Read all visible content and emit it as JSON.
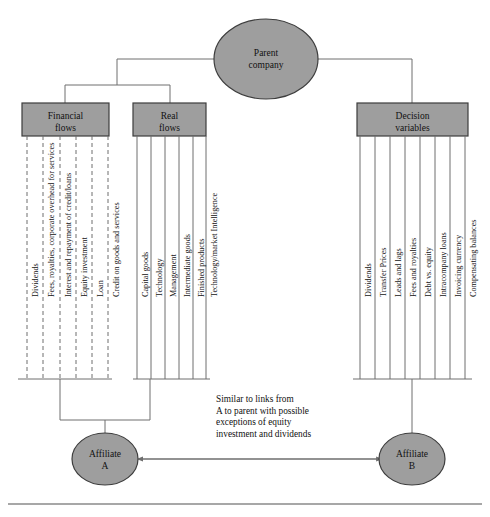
{
  "diagram": {
    "colors": {
      "node_fill": "#9e9e9e",
      "node_stroke": "#3d3d3d",
      "line": "#6e6e6e",
      "text": "#111111",
      "background": "#ffffff"
    },
    "nodes": {
      "parent": {
        "label": "Parent\ncompany",
        "line1": "Parent",
        "line2": "company",
        "shape": "ellipse"
      },
      "affiliate_a": {
        "label": "Affiliate\nA",
        "line1": "Affiliate",
        "line2": "A",
        "shape": "ellipse"
      },
      "affiliate_b": {
        "label": "Affiliate\nB",
        "line1": "Affiliate",
        "line2": "B",
        "shape": "ellipse"
      }
    },
    "boxes": {
      "financial_flows": {
        "line1": "Financial",
        "line2": "flows"
      },
      "real_flows": {
        "line1": "Real",
        "line2": "flows"
      },
      "decision_variables": {
        "line1": "Decision",
        "line2": "variables"
      }
    },
    "financial_flow_items": [
      "Dividends",
      "Fees, royalties, corporate overhead for services",
      "Interest and repayment of credit/loans",
      "Equity investment",
      "Loan",
      "Credit on goods and services"
    ],
    "real_flow_items": [
      "Capital goods",
      "Technology",
      "Management",
      "Intermediate goods",
      "Finished products",
      "Technology/market Intelligence"
    ],
    "decision_variable_items": [
      "Dividends",
      "Transfer Prices",
      "Leads and lags",
      "Fees and royalties",
      "Debt vs. equity",
      "Intracompany loans",
      "Invoicing currency",
      "Compensating balances"
    ],
    "note": {
      "line1": "Similar to links from",
      "line2": "A to parent with possible",
      "line3": "exceptions of equity",
      "line4": "investment and dividends",
      "text": "Similar to links from\nA to parent with possible\nexceptions of equity\ninvestment and dividends"
    }
  }
}
